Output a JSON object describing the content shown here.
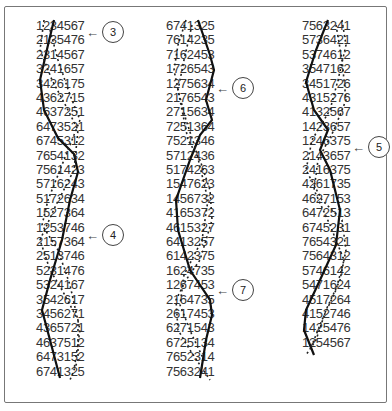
{
  "columns": [
    {
      "rows": [
        "1234567",
        "2135476",
        "2314567",
        "3241657",
        "3426175",
        "4362715",
        "4637251",
        "6473521",
        "6745312",
        "7654132",
        "7561423",
        "5716243",
        "5172634",
        "1527364",
        "1253746",
        "2157364",
        "2513746",
        "5231476",
        "5324167",
        "3542617",
        "3456271",
        "4365721",
        "4637512",
        "6473152",
        "6741325"
      ]
    },
    {
      "rows": [
        "6741325",
        "7614235",
        "7162453",
        "1726543",
        "1275634",
        "2176543",
        "2715634",
        "7251364",
        "7521346",
        "5712436",
        "5174263",
        "1547623",
        "1456732",
        "4165372",
        "4615327",
        "6413257",
        "6142375",
        "1624735",
        "1267453",
        "2164735",
        "2617453",
        "6271543",
        "6725134",
        "7652314",
        "7563241"
      ]
    },
    {
      "rows": [
        "7563241",
        "5736421",
        "5374612",
        "3547162",
        "3451726",
        "4315276",
        "4132567",
        "1423657",
        "1246375",
        "2143657",
        "2416375",
        "4261735",
        "4627153",
        "6472513",
        "6745231",
        "7654321",
        "7564312",
        "5746142",
        "5471624",
        "4517264",
        "4152746",
        "1425476",
        "1254567"
      ]
    }
  ],
  "callouts": [
    {
      "label": "3",
      "arrow": "←"
    },
    {
      "label": "4",
      "arrow": "←"
    },
    {
      "label": "6",
      "arrow": "←"
    },
    {
      "label": "7",
      "arrow": "←"
    },
    {
      "label": "5",
      "arrow": "←"
    }
  ],
  "colors": {
    "line": "#111111",
    "frame": "#777777",
    "text": "#333333"
  }
}
